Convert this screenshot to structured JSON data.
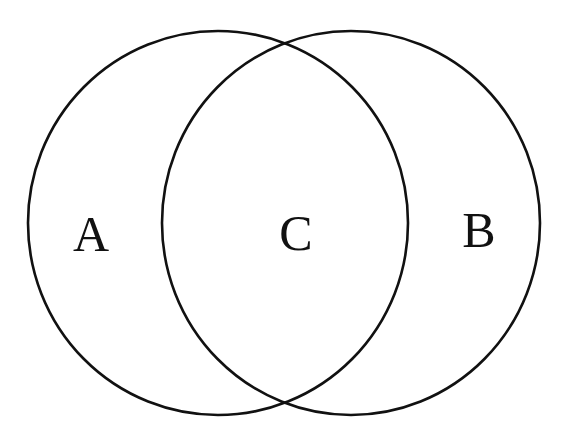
{
  "diagram": {
    "type": "venn",
    "background": "#ffffff",
    "stroke_color": "#111111",
    "label_color": "#111111",
    "sets": [
      {
        "id": "left",
        "label": "A"
      },
      {
        "id": "right",
        "label": "B"
      }
    ],
    "labels": {
      "a": "A",
      "b": "B",
      "c": "C"
    },
    "regions": [
      {
        "name": "A",
        "description": "left-only region"
      },
      {
        "name": "C",
        "description": "intersection of both circles"
      },
      {
        "name": "B",
        "description": "right-only region"
      }
    ]
  }
}
